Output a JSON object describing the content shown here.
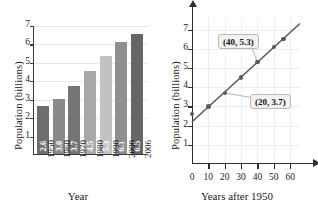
{
  "chart_data": [
    {
      "type": "bar",
      "title": "",
      "xlabel": "Year",
      "ylabel": "Population (billions)",
      "categories": [
        "1950",
        "1960",
        "1970",
        "1980",
        "1990",
        "2000",
        "2006"
      ],
      "values": [
        2.6,
        3.0,
        3.7,
        4.5,
        5.3,
        6.1,
        6.5
      ],
      "value_labels": [
        "2.6",
        "3.0",
        "3.7",
        "4.5",
        "5.3",
        "6.1",
        "6.5"
      ],
      "bar_colors": [
        "#6d6d6d",
        "#8a8a8a",
        "#747474",
        "#a8a8a8",
        "#c2c2c2",
        "#8f8f8f",
        "#666666"
      ],
      "ylim": [
        0,
        7
      ],
      "yticks": [
        1,
        2,
        3,
        4,
        5,
        6,
        7
      ],
      "ytick_labels": [
        "1",
        "2",
        "3",
        "4",
        "5",
        "6",
        "7"
      ],
      "grid": true,
      "legend": "none"
    },
    {
      "type": "scatter",
      "title": "",
      "xlabel": "Years after 1950",
      "ylabel": "Population (billions)",
      "x_axis_letter": "x",
      "y_axis_letter": "y",
      "x": [
        0,
        10,
        20,
        30,
        40,
        50,
        56
      ],
      "y": [
        2.6,
        3.0,
        3.7,
        4.5,
        5.3,
        6.1,
        6.5
      ],
      "xlim": [
        0,
        66
      ],
      "ylim": [
        0,
        7.6
      ],
      "xticks": [
        0,
        10,
        20,
        30,
        40,
        50,
        60
      ],
      "xtick_labels": [
        "0",
        "10",
        "20",
        "30",
        "40",
        "50",
        "60"
      ],
      "yticks": [
        1,
        2,
        3,
        4,
        5,
        6,
        7
      ],
      "ytick_labels": [
        "1",
        "2",
        "3",
        "4",
        "5",
        "6",
        "7"
      ],
      "trendline": {
        "intercept": 2.2,
        "slope": 0.0775
      },
      "grid": true,
      "legend": "none",
      "annotations": [
        {
          "label": "(40, 5.3)",
          "point_x": 40,
          "point_y": 5.3
        },
        {
          "label": "(20, 3.7)",
          "point_x": 20,
          "point_y": 3.7
        }
      ]
    }
  ]
}
